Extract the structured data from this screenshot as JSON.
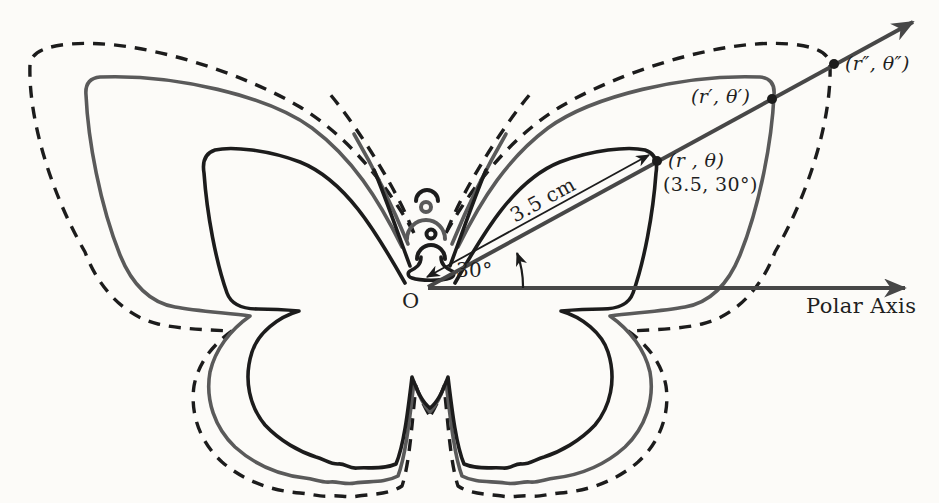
{
  "figure": {
    "origin_label": "O",
    "polar_axis_label": "Polar Axis",
    "angle_label": "30°",
    "radius_label": "3.5 cm",
    "point1_label": "(r , θ)",
    "point1_coords": "(3.5, 30°)",
    "point2_label": "(r′, θ′)",
    "point3_label": "(r″, θ″)",
    "colors": {
      "ink": "#1c1c1c",
      "gray_outline": "#5a5a5a",
      "axis_gray": "#474747",
      "background": "#fcfbf8"
    }
  }
}
